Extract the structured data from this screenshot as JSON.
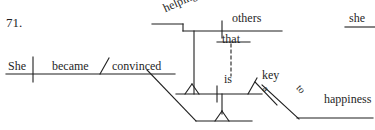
{
  "exercise": {
    "number": "71.",
    "type": "reed-kellogg-sentence-diagram",
    "sentence": "She became convinced that helping others is a key to happiness."
  },
  "ink_color": "#1f1f1f",
  "background_color": "#ffffff",
  "words": {
    "subject_main": "She",
    "verb_main": "became",
    "predicate_adjective": "convinced",
    "gerund_subject": "helping",
    "gerund_object": "others",
    "subordinator": "that",
    "clause_verb": "is",
    "clause_complement": "key",
    "article": "a",
    "preposition": "to",
    "prep_object": "happiness",
    "stray_top_right": "she"
  },
  "lines": {
    "main_baseline": {
      "x1": 6,
      "y1": 74,
      "x2": 175,
      "y2": 74
    },
    "subject_verb_divider": {
      "x1": 33,
      "y1": 57,
      "x2": 33,
      "y2": 82
    },
    "predicate_slant": {
      "x1": 100,
      "y1": 74,
      "x2": 108,
      "y2": 59
    },
    "clause_connector_diagonal": {
      "x1": 147,
      "y1": 69,
      "x2": 196,
      "y2": 121
    },
    "clause_baseline": {
      "x1": 176,
      "y1": 94,
      "x2": 252,
      "y2": 94
    },
    "clause_stand_stem": {
      "x1": 196,
      "y1": 121,
      "x2": 252,
      "y2": 121
    },
    "gerund_top_rail": {
      "x1": 152,
      "y1": 24,
      "x2": 183,
      "y2": 24
    },
    "gerund_step_vertical": {
      "x1": 183,
      "y1": 24,
      "x2": 183,
      "y2": 31
    },
    "gerund_object_rail": {
      "x1": 183,
      "y1": 31,
      "x2": 282,
      "y2": 31
    },
    "gerund_object_divider": {
      "x1": 223,
      "y1": 22,
      "x2": 223,
      "y2": 38
    },
    "gerund_support_post": {
      "x1": 194,
      "y1": 31,
      "x2": 194,
      "y2": 94
    },
    "that_rail": {
      "x1": 217,
      "y1": 42,
      "x2": 250,
      "y2": 42
    },
    "that_dashed": {
      "x1": 231,
      "y1": 42,
      "x2": 231,
      "y2": 76
    },
    "clause_subject_divider": {
      "x1": 217,
      "y1": 86,
      "x2": 217,
      "y2": 102
    },
    "complement_slant": {
      "x1": 248,
      "y1": 94,
      "x2": 256,
      "y2": 78
    },
    "prep_slant": {
      "x1": 262,
      "y1": 85,
      "x2": 297,
      "y2": 118
    },
    "prep_object_rail": {
      "x1": 297,
      "y1": 118,
      "x2": 372,
      "y2": 118
    },
    "she_top_rail": {
      "x1": 345,
      "y1": 27,
      "x2": 375,
      "y2": 27
    },
    "article_slant": {
      "x1": 252,
      "y1": 82,
      "x2": 276,
      "y2": 105
    }
  },
  "glyphs": {
    "stand_left": "pedestal-triangle-left",
    "stand_right": "pedestal-triangle-right",
    "dashed_connector": "dashed-vertical-line"
  }
}
